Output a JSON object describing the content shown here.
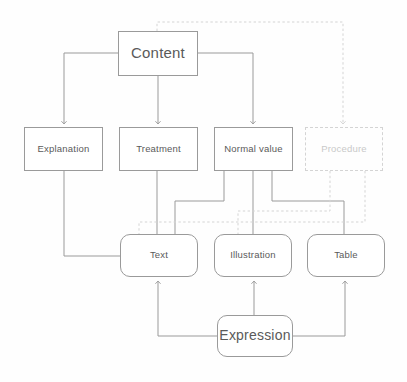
{
  "diagram": {
    "type": "flowchart",
    "background_color": "#fefefe",
    "solid_line_color": "#9a9a9a",
    "dashed_line_color": "#d4d4d4",
    "text_color": "#5a5a5a",
    "dashed_text_color": "#c9c9c9",
    "nodes": [
      {
        "id": "content",
        "label": "Content",
        "shape": "rectangle",
        "style": "solid",
        "x": 118,
        "y": 31,
        "w": 80,
        "h": 45,
        "font": "lbl-lg"
      },
      {
        "id": "explanation",
        "label": "Explanation",
        "shape": "rectangle",
        "style": "solid",
        "x": 24,
        "y": 127,
        "w": 79,
        "h": 44,
        "font": "lbl-sm"
      },
      {
        "id": "treatment",
        "label": "Treatment",
        "shape": "rectangle",
        "style": "solid",
        "x": 119,
        "y": 127,
        "w": 79,
        "h": 44,
        "font": "lbl-sm"
      },
      {
        "id": "normal_value",
        "label": "Normal value",
        "shape": "rectangle",
        "style": "solid",
        "x": 214,
        "y": 127,
        "w": 79,
        "h": 44,
        "font": "lbl-sm"
      },
      {
        "id": "procedure",
        "label": "Procedure",
        "shape": "rectangle",
        "style": "dashed",
        "x": 305,
        "y": 127,
        "w": 78,
        "h": 44,
        "font": "lbl-sm"
      },
      {
        "id": "text",
        "label": "Text",
        "shape": "rounded-rectangle",
        "style": "solid",
        "x": 120,
        "y": 234,
        "w": 78,
        "h": 43,
        "font": "lbl-sm"
      },
      {
        "id": "illustration",
        "label": "Illustration",
        "shape": "rounded-rectangle",
        "style": "solid",
        "x": 214,
        "y": 234,
        "w": 78,
        "h": 43,
        "font": "lbl-sm"
      },
      {
        "id": "table",
        "label": "Table",
        "shape": "rounded-rectangle",
        "style": "solid",
        "x": 307,
        "y": 234,
        "w": 78,
        "h": 43,
        "font": "lbl-sm"
      },
      {
        "id": "expression",
        "label": "Expression",
        "shape": "rounded-rectangle",
        "style": "solid",
        "x": 217,
        "y": 315,
        "w": 76,
        "h": 42,
        "font": "lbl-md"
      }
    ],
    "edges": [
      {
        "id": "content-to-explanation",
        "from": "content",
        "to": "explanation",
        "style": "solid",
        "arrow": true
      },
      {
        "id": "content-to-treatment",
        "from": "content",
        "to": "treatment",
        "style": "solid",
        "arrow": true
      },
      {
        "id": "content-to-normal-value",
        "from": "content",
        "to": "normal value",
        "style": "solid",
        "arrow": true
      },
      {
        "id": "content-to-procedure",
        "from": "content",
        "to": "procedure",
        "style": "dashed",
        "arrow": true
      },
      {
        "id": "explanation-to-text",
        "from": "explanation",
        "to": "text",
        "style": "solid",
        "arrow": false
      },
      {
        "id": "treatment-to-text",
        "from": "treatment",
        "to": "text",
        "style": "solid",
        "arrow": false
      },
      {
        "id": "normal-value-to-text",
        "from": "normal value",
        "to": "text",
        "style": "solid",
        "arrow": false
      },
      {
        "id": "normal-value-to-illustration",
        "from": "normal value",
        "to": "illustration",
        "style": "solid",
        "arrow": false
      },
      {
        "id": "normal-value-to-table",
        "from": "normal value",
        "to": "table",
        "style": "solid",
        "arrow": false
      },
      {
        "id": "procedure-to-text",
        "from": "procedure",
        "to": "text",
        "style": "dashed",
        "arrow": false
      },
      {
        "id": "procedure-to-illustration",
        "from": "procedure",
        "to": "illustration",
        "style": "dashed",
        "arrow": false
      },
      {
        "id": "expression-to-text",
        "from": "expression",
        "to": "text",
        "style": "solid",
        "arrow": true
      },
      {
        "id": "expression-to-illustration",
        "from": "expression",
        "to": "illustration",
        "style": "solid",
        "arrow": true
      },
      {
        "id": "expression-to-table",
        "from": "expression",
        "to": "table",
        "style": "solid",
        "arrow": true
      }
    ]
  }
}
